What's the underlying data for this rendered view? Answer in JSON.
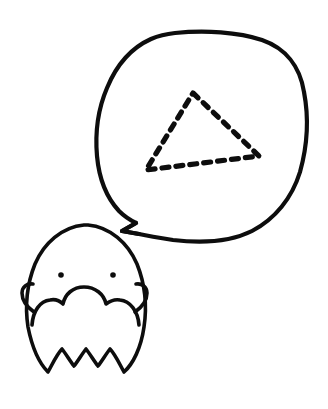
{
  "canvas": {
    "width": 328,
    "height": 409,
    "background_color": "#ffffff",
    "ink_color": "#0d0d0d",
    "title": "Bald bearded man with thought of a triangle",
    "medium": "hand-drawn black ink line art"
  },
  "scene": {
    "description": "A hand-drawn cartoon of a bald, bearded man's head in the lower left, with a large rounded speech bubble above and to the right containing a dashed triangle outline.",
    "elements": [
      "speech-bubble",
      "dashed-triangle",
      "man-head",
      "beard",
      "eyes",
      "ears"
    ]
  },
  "speech_bubble": {
    "label": "speech bubble",
    "shape": "irregular hand-drawn rounded blob",
    "stroke_width": 4.2,
    "bounds": {
      "x": 97,
      "y": 31,
      "width": 208,
      "height": 211
    },
    "tail": {
      "label": "bubble tail",
      "shape": "sharp v-shaped point",
      "tip": {
        "x": 122,
        "y": 231
      }
    },
    "outline_path": "M 175 33 C 205 30 238 32 262 40 C 285 48 300 66 304 92 C 309 118 307 147 300 172 C 292 198 275 219 252 231 C 228 243 198 243 173 240 C 160 238 148 236 139 234 L 122 231 L 136 223 C 130 220 124 216 119 211 C 107 198 99 178 97 156 C 95 133 98 109 107 88 C 116 66 131 48 151 39 C 158 36 166 34 175 33 Z",
    "tail_path": "M 139 234 L 122 231 L 136 223"
  },
  "dashed_triangle": {
    "label": "dashed triangle",
    "stroke_width": 5.2,
    "dash_pattern": "7 7",
    "vertices": [
      {
        "name": "apex",
        "x": 193,
        "y": 93
      },
      {
        "name": "bottom-right",
        "x": 259,
        "y": 156
      },
      {
        "name": "bottom-left",
        "x": 146,
        "y": 170
      }
    ],
    "path": "M 193 93 L 259 156 L 146 170 Z"
  },
  "man_head": {
    "label": "bald head",
    "stroke_width": 3.6,
    "bounds": {
      "x": 22,
      "y": 224,
      "width": 124,
      "height": 148
    },
    "skull_path": "M 88 225 C 110 227 128 243 137 264 C 145 284 147 307 144 327 C 141 348 133 364 124 372 C 119 363 115 354 110 349 C 106 354 102 361 98 366 C 94 361 90 354 86 349 C 82 354 78 361 74 366 C 70 361 66 354 62 349 C 57 354 53 363 48 372 C 39 363 32 347 28 327 C 25 307 27 284 35 264 C 44 243 62 227 84 225 Z",
    "eyes": [
      {
        "name": "left-eye",
        "cx": 61,
        "cy": 275,
        "r": 2.8
      },
      {
        "name": "right-eye",
        "cx": 113,
        "cy": 275,
        "r": 2.8
      }
    ],
    "ears": [
      {
        "name": "left-ear",
        "path": "M 33 284 C 27 283 22 287 22 293 C 22 300 27 307 34 312"
      },
      {
        "name": "right-ear",
        "path": "M 136 284 C 142 283 147 287 147 293 C 147 300 142 307 135 312"
      }
    ],
    "beard": {
      "label": "beard",
      "stroke_width": 3.6,
      "path": "M 32 325 C 33 311 40 301 50 300 C 55 299 60 301 63 304 C 65 294 73 287 84 287 C 95 287 104 294 106 304 C 110 301 115 299 120 300 C 130 301 138 311 139 325"
    }
  },
  "accessibility": {
    "alt_text": "Hand-drawn line illustration of a bald bearded man's head with a large speech bubble above him containing a triangle drawn with dashed lines."
  }
}
